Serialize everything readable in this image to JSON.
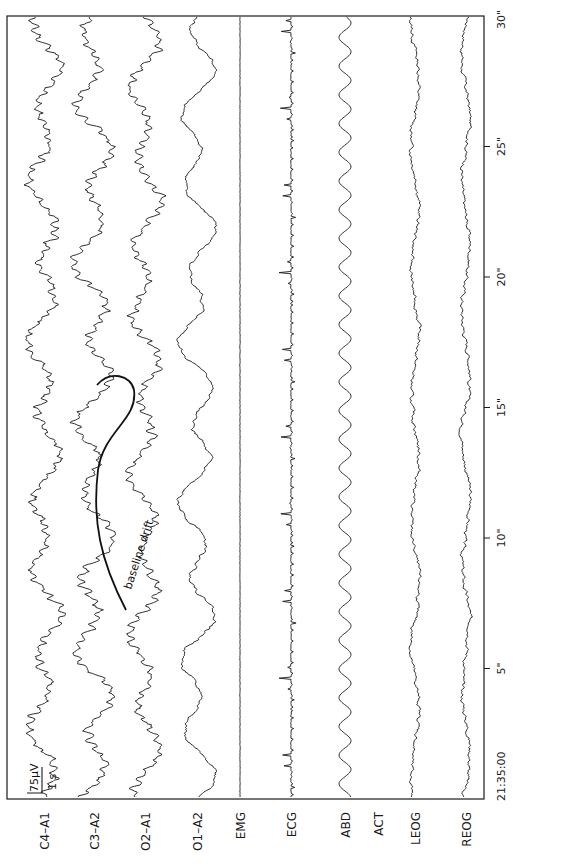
{
  "chart_data": {
    "type": "line",
    "title": "",
    "orientation": "rotated-90-ccw",
    "xlabel": "",
    "ylabel": "",
    "time_axis": {
      "start_label": "21:35:00",
      "ticks": [
        {
          "seconds": 0,
          "label": "21:35:00"
        },
        {
          "seconds": 5,
          "label": "5\""
        },
        {
          "seconds": 10,
          "label": "10\""
        },
        {
          "seconds": 15,
          "label": "15\""
        },
        {
          "seconds": 20,
          "label": "20\""
        },
        {
          "seconds": 25,
          "label": "25\""
        },
        {
          "seconds": 30,
          "label": "30\""
        }
      ],
      "range_seconds": [
        0,
        30
      ]
    },
    "calibration": {
      "amplitude_label": "75μV",
      "time_label": "1 s"
    },
    "annotation": {
      "text": "baseline drift",
      "channel": "C3-A2",
      "approx_seconds": [
        6.5,
        16.5
      ]
    },
    "grid": false,
    "legend": "none",
    "series": [
      {
        "name": "C4–A1",
        "kind": "eeg",
        "amp": 11,
        "noise": 2.6,
        "seed": 11
      },
      {
        "name": "C3–A2",
        "kind": "eeg",
        "amp": 14,
        "noise": 2.4,
        "seed": 23
      },
      {
        "name": "O2–A1",
        "kind": "eeg",
        "amp": 11,
        "noise": 2.2,
        "seed": 37
      },
      {
        "name": "O1–A2",
        "kind": "eeg-slow",
        "amp": 13,
        "noise": 1.4,
        "seed": 41
      },
      {
        "name": "EMG",
        "kind": "flat",
        "amp": 0.4,
        "noise": 0.4,
        "seed": 5
      },
      {
        "name": "ECG",
        "kind": "ecg",
        "amp": 12,
        "beat_period_s": 0.42,
        "seed": 7
      },
      {
        "name": "ABD",
        "kind": "resp",
        "amp": 6,
        "period_s": 1.1,
        "seed": 9
      },
      {
        "name": "ACT",
        "kind": "none"
      },
      {
        "name": "LEOG",
        "kind": "eog",
        "amp": 4,
        "noise": 1.4,
        "seed": 13
      },
      {
        "name": "REOG",
        "kind": "eog",
        "amp": 4,
        "noise": 1.4,
        "seed": 17
      }
    ]
  },
  "labels": {
    "channels": [
      "C4–A1",
      "C3–A2",
      "O2–A1",
      "O1–A2",
      "EMG",
      "ECG",
      "ABD",
      "ACT",
      "LEOG",
      "REOG"
    ],
    "ticks": [
      "21:35:00",
      "5\"",
      "10\"",
      "15\"",
      "20\"",
      "25\"",
      "30\""
    ],
    "calibration_amp": "75μV",
    "calibration_time": "1 s",
    "annotation": "baseline drift"
  },
  "layout": {
    "frame": {
      "left": 7,
      "top": 16,
      "right": 484,
      "bottom": 799
    },
    "channel_x": [
      44,
      94,
      145,
      197,
      240,
      291,
      345,
      378,
      415,
      466
    ],
    "px_per_second": 26.1,
    "ink_color": "#1a1a1a"
  }
}
